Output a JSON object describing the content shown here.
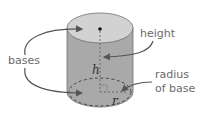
{
  "diagram": {
    "labels": {
      "bases": "bases",
      "height": "height",
      "radius_line1": "radius",
      "radius_line2": "of base",
      "h_var": "h",
      "r_var": "r"
    },
    "colors": {
      "top_face": "#d2d2d2",
      "side": "#a9a9a9",
      "outline": "#6e6e6e",
      "arrow": "#555555",
      "label_text": "#6a6a6a"
    }
  }
}
